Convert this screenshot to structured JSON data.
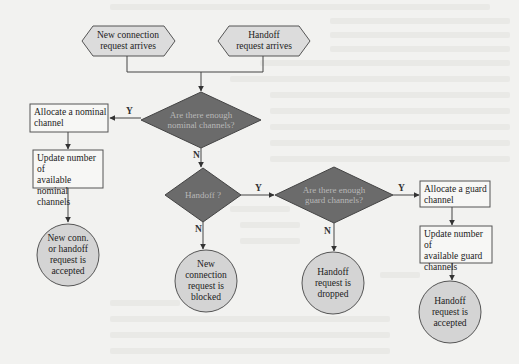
{
  "diagram": {
    "type": "flowchart",
    "colors": {
      "background": "#f2f2f0",
      "hexagon_fill": "#dcdcdc",
      "decision_fill": "#6b6b6b",
      "decision_text": "#c0c0c0",
      "process_fill": "#f7f7f5",
      "terminal_fill": "#d4d4d4",
      "line": "#333333"
    },
    "start_nodes": [
      {
        "id": "new-conn",
        "label": "New connection\nrequest arrives"
      },
      {
        "id": "handoff-arrives",
        "label": "Handoff\nrequest arrives"
      }
    ],
    "decisions": [
      {
        "id": "enough-nominal",
        "label": "Are there enough\nnominal channels?"
      },
      {
        "id": "is-handoff",
        "label": "Handoff ?"
      },
      {
        "id": "enough-guard",
        "label": "Are there enough\nguard channels?"
      }
    ],
    "processes": [
      {
        "id": "alloc-nominal",
        "label": "Allocate a nominal\nchannel"
      },
      {
        "id": "update-nominal",
        "label": "Update number of\navailable nominal\nchannels"
      },
      {
        "id": "alloc-guard",
        "label": "Allocate a guard\nchannel"
      },
      {
        "id": "update-guard",
        "label": "Update number of\navailable guard\nchannels"
      }
    ],
    "terminals": [
      {
        "id": "accepted-nominal",
        "label": "New conn.\nor handoff\nrequest is\naccepted"
      },
      {
        "id": "blocked",
        "label": "New\nconnection\nrequest is\nblocked"
      },
      {
        "id": "dropped",
        "label": "Handoff\nrequest is\ndropped"
      },
      {
        "id": "accepted-guard",
        "label": "Handoff\nrequest is\naccepted"
      }
    ],
    "edge_labels": {
      "nominal_yes": "Y",
      "nominal_no": "N",
      "handoff_yes": "Y",
      "handoff_no": "N",
      "guard_yes": "Y",
      "guard_no": "N"
    },
    "edges": [
      {
        "from": "new-conn",
        "to": "enough-nominal"
      },
      {
        "from": "handoff-arrives",
        "to": "enough-nominal"
      },
      {
        "from": "enough-nominal",
        "to": "alloc-nominal",
        "label": "Y"
      },
      {
        "from": "enough-nominal",
        "to": "is-handoff",
        "label": "N"
      },
      {
        "from": "alloc-nominal",
        "to": "update-nominal"
      },
      {
        "from": "update-nominal",
        "to": "accepted-nominal"
      },
      {
        "from": "is-handoff",
        "to": "enough-guard",
        "label": "Y"
      },
      {
        "from": "is-handoff",
        "to": "blocked",
        "label": "N"
      },
      {
        "from": "enough-guard",
        "to": "alloc-guard",
        "label": "Y"
      },
      {
        "from": "enough-guard",
        "to": "dropped",
        "label": "N"
      },
      {
        "from": "alloc-guard",
        "to": "update-guard"
      },
      {
        "from": "update-guard",
        "to": "accepted-guard"
      }
    ]
  }
}
